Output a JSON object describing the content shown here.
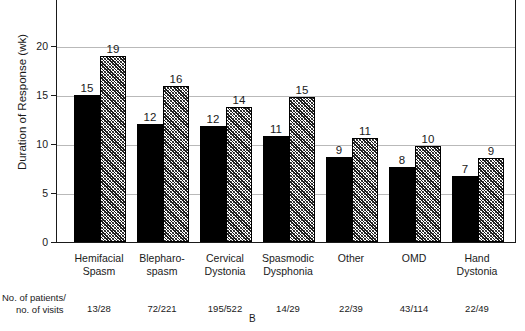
{
  "chart_data": {
    "type": "bar",
    "title": "",
    "panel_label": "B",
    "xlabel": "",
    "ylabel": "Duration of Response (wk)",
    "ylim": [
      0,
      25
    ],
    "yticks": [
      0,
      5,
      10,
      15,
      20
    ],
    "ytick_labels": [
      "0",
      "5",
      "10",
      "15",
      "20"
    ],
    "grid": true,
    "legend": "none",
    "categories": [
      "Hemifacial Spasm",
      "Blepharo-spasm",
      "Cervical Dystonia",
      "Spasmodic Dysphonia",
      "Other",
      "OMD",
      "Hand Dystonia"
    ],
    "category_lines": [
      [
        "Hemifacial",
        "Spasm"
      ],
      [
        "Blepharo-",
        "spasm"
      ],
      [
        "Cervical",
        "Dystonia"
      ],
      [
        "Spasmodic",
        "Dysphonia"
      ],
      [
        "Other",
        ""
      ],
      [
        "OMD",
        ""
      ],
      [
        "Hand",
        "Dystonia"
      ]
    ],
    "series": [
      {
        "name": "solid",
        "style": "solid-black",
        "values": [
          15,
          12,
          12,
          11,
          9,
          8,
          7
        ],
        "bar_heights_wk": [
          15.0,
          12.0,
          11.8,
          10.8,
          8.7,
          7.7,
          6.7
        ]
      },
      {
        "name": "hatched",
        "style": "hatched",
        "values": [
          19,
          16,
          14,
          15,
          11,
          10,
          9
        ],
        "bar_heights_wk": [
          19.0,
          15.9,
          13.8,
          14.8,
          10.6,
          9.8,
          8.6
        ]
      }
    ],
    "footer": {
      "label_line1": "No. of patients/",
      "label_line2": "no. of visits",
      "values": [
        "13/28",
        "72/221",
        "195/522",
        "14/29",
        "22/39",
        "43/114",
        "22/49"
      ]
    },
    "colors": {
      "solid_bar": "#000000",
      "hatch_bar_base": "#ffffff",
      "hatch_bar_lines": "#1a1a1a",
      "axis": "#1a1a1a",
      "grid": "#b9b9b9",
      "text": "#1a1a1a",
      "background": "#ffffff"
    }
  }
}
